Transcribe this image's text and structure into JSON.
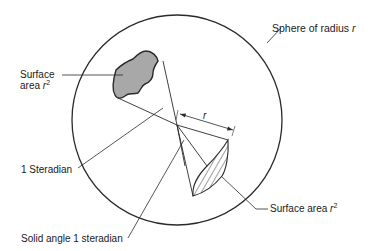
{
  "diagram": {
    "labels": {
      "sphere": "Sphere of radius",
      "sphere_var": "r",
      "surface_area_left_line1": "Surface",
      "surface_area_left_line2": "area",
      "surface_area_left_var": "r",
      "surface_area_left_exp": "2",
      "one_steradian": "1  Steradian",
      "solid_angle": "Solid angle 1 steradian",
      "surface_area_right": "Surface area",
      "surface_area_right_var": "r",
      "surface_area_right_exp": "2",
      "radius_dim": "r"
    },
    "colors": {
      "stroke": "#2a2a2a",
      "shaded_fill": "#a8a8a8",
      "background": "#ffffff"
    }
  }
}
